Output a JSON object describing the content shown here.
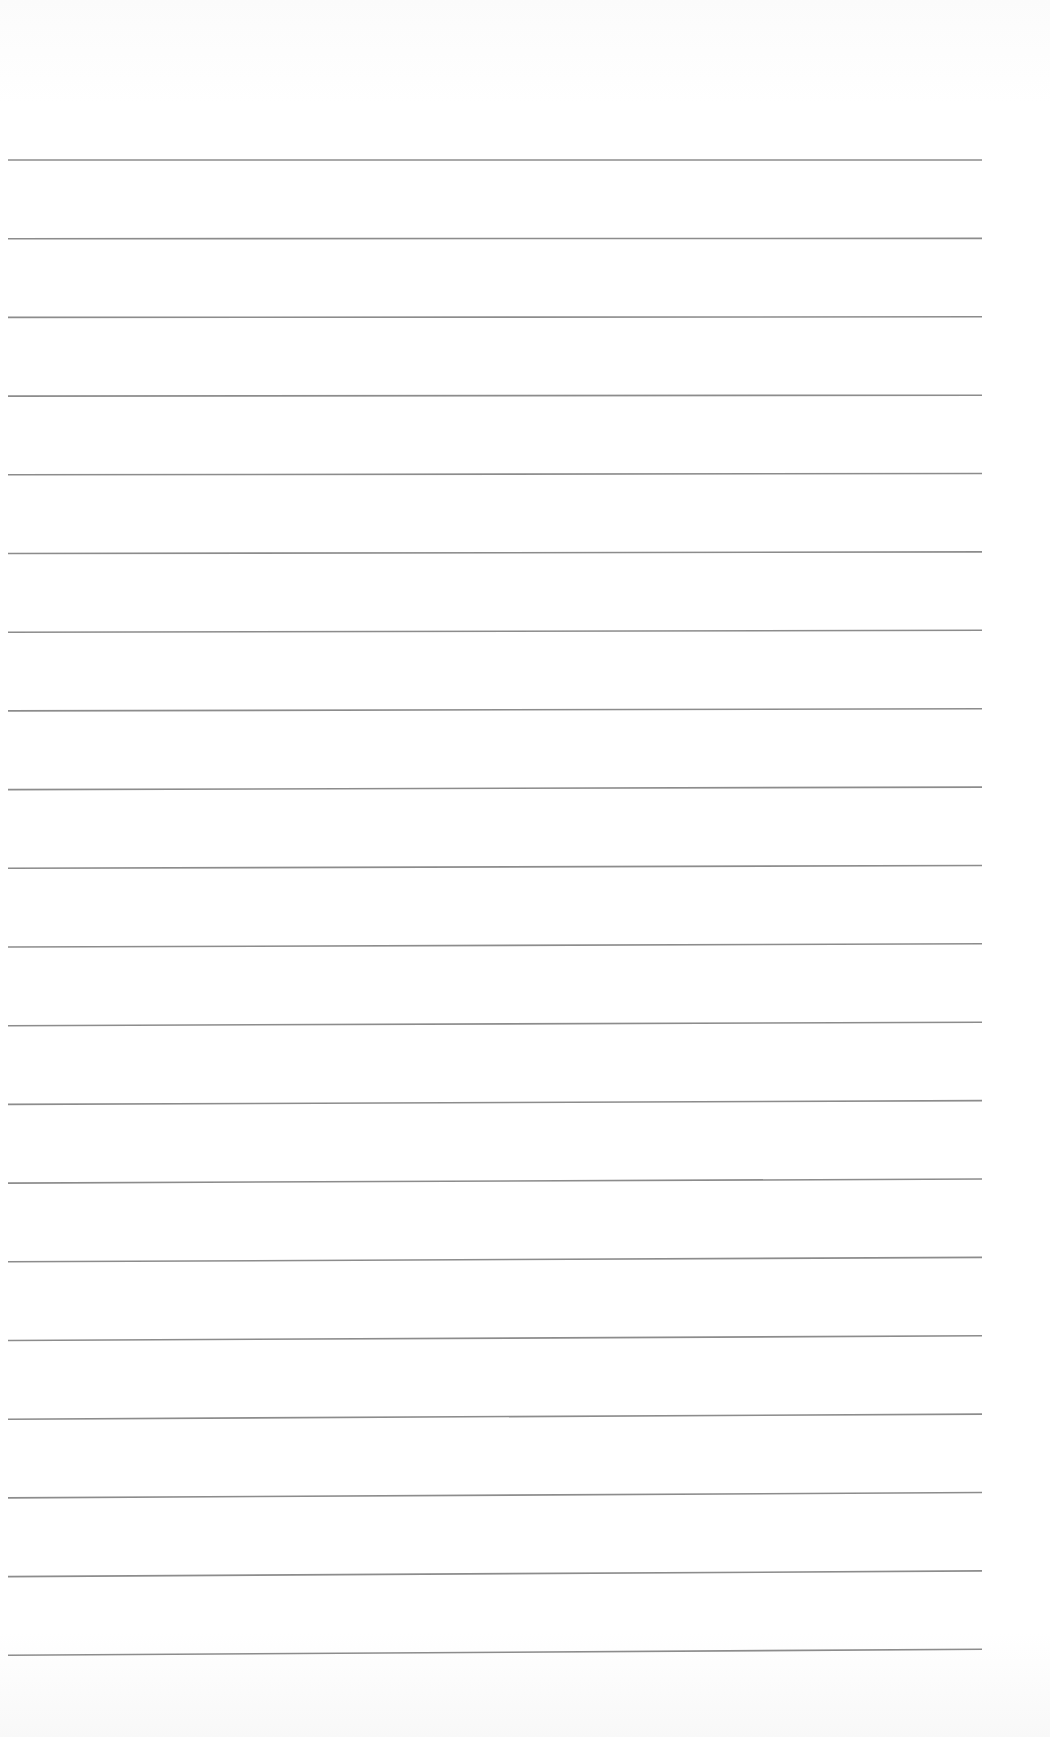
{
  "document": {
    "type": "blank lined paper",
    "line_count": 20,
    "line_color": "#8c8c8c",
    "background_color": "#ffffff",
    "first_line_y": 160,
    "line_spacing": 78.7,
    "line_start_x": 8,
    "line_end_x": 982,
    "right_end_rise": 6
  }
}
